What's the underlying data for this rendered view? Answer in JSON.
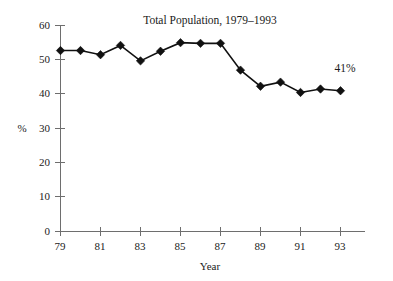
{
  "chart_data": {
    "type": "line",
    "title": "Total Population, 1979–1993",
    "xlabel": "Year",
    "ylabel": "%",
    "x": [
      1979,
      1980,
      1981,
      1982,
      1983,
      1984,
      1985,
      1986,
      1987,
      1988,
      1989,
      1990,
      1991,
      1992,
      1993
    ],
    "categories": [
      "79",
      "80",
      "81",
      "82",
      "83",
      "84",
      "85",
      "86",
      "87",
      "88",
      "89",
      "90",
      "91",
      "92",
      "93"
    ],
    "values": [
      52.7,
      52.7,
      51.5,
      54.2,
      49.7,
      52.5,
      55.0,
      54.8,
      54.8,
      47.0,
      42.3,
      43.5,
      40.5,
      41.5,
      41.0
    ],
    "series": [
      {
        "name": "Total Population",
        "values": [
          52.7,
          52.7,
          51.5,
          54.2,
          49.7,
          52.5,
          55.0,
          54.8,
          54.8,
          47.0,
          42.3,
          43.5,
          40.5,
          41.5,
          41.0
        ]
      }
    ],
    "xlim": [
      1979,
      1994
    ],
    "ylim": [
      0,
      60
    ],
    "yticks": [
      0,
      10,
      20,
      30,
      40,
      50,
      60
    ],
    "ytick_labels": [
      "0",
      "10",
      "20",
      "30",
      "40",
      "50",
      "60"
    ],
    "xticks": [
      1979,
      1981,
      1983,
      1985,
      1987,
      1989,
      1991,
      1993
    ],
    "xtick_labels": [
      "79",
      "81",
      "83",
      "85",
      "87",
      "89",
      "91",
      "93"
    ],
    "grid": false,
    "legend": "none",
    "marker": "diamond",
    "line_color": "#111111",
    "marker_color": "#111111",
    "axis_color": "#6e6e6e",
    "background_color": "#ffffff",
    "annotations": [
      {
        "text": "41%",
        "x": 1993,
        "y": 41.0,
        "name": "last-value-annotation"
      }
    ]
  }
}
